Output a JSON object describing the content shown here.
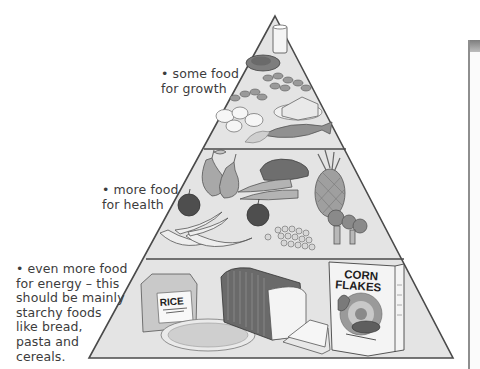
{
  "diagram": {
    "type": "food-pyramid",
    "colors": {
      "background": "#ffffff",
      "pyramid_fill": "#e4e4e4",
      "outline": "#4a4a4a",
      "text": "#3c3c3c"
    },
    "tiers": [
      {
        "level": "top",
        "label": "• some food\nfor growth",
        "foods": [
          "glass of milk",
          "meat",
          "beans",
          "eggs",
          "cheese",
          "fish",
          "chicken"
        ]
      },
      {
        "level": "middle",
        "label": "• more food\nfor health",
        "foods": [
          "pears",
          "apples",
          "bananas",
          "sweet potato",
          "carrots",
          "peas",
          "pineapple",
          "broccoli"
        ]
      },
      {
        "level": "bottom",
        "label": "• even more food\nfor energy – this\nshould be mainly\nstarchy foods\nlike bread,\npasta and\ncereals.",
        "foods": [
          "rice bag",
          "pasta",
          "sliced bread loaf",
          "toast",
          "corn flakes box"
        ]
      }
    ],
    "packaging_text": {
      "rice": "RICE",
      "cereal_line1": "CORN",
      "cereal_line2": "FLAKES"
    }
  }
}
